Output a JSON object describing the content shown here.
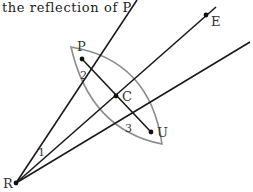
{
  "caption": "the reflection of P",
  "colors": {
    "line": "#1a1a1a",
    "lens": "#8c8c8c",
    "label": "#333333",
    "background": "#ffffff"
  },
  "points": {
    "P": {
      "label": "P",
      "x": 82,
      "y": 59
    },
    "C": {
      "label": "C",
      "x": 116,
      "y": 96
    },
    "U": {
      "label": "U",
      "x": 151,
      "y": 132
    },
    "R": {
      "label": "R",
      "x": 16,
      "y": 183
    },
    "E": {
      "label": "E",
      "x": 206,
      "y": 15
    }
  },
  "angle_labels": {
    "one": "1",
    "two": "2",
    "three": "3"
  },
  "lines": [
    {
      "name": "ray-R-P-extended",
      "x1": 16,
      "y1": 183,
      "x2": 137,
      "y2": 0
    },
    {
      "name": "ray-R-C-E",
      "x1": 16,
      "y1": 183,
      "x2": 216,
      "y2": 7
    },
    {
      "name": "ray-R-U-extended",
      "x1": 16,
      "y1": 183,
      "x2": 250,
      "y2": 42
    },
    {
      "name": "segment-P-U",
      "x1": 82,
      "y1": 59,
      "x2": 151,
      "y2": 132
    }
  ],
  "lens": {
    "tip_top": {
      "x": 71,
      "y": 47
    },
    "tip_bottom": {
      "x": 162,
      "y": 144
    }
  }
}
